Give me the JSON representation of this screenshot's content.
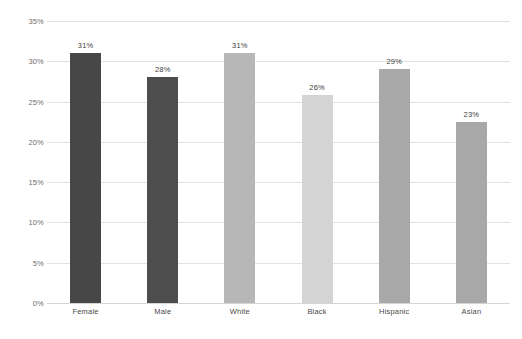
{
  "chart_data": {
    "type": "bar",
    "title": "",
    "subtitle": "",
    "xlabel": "",
    "ylabel": "",
    "categories": [
      "Female",
      "Male",
      "White",
      "Black",
      "Hispanic",
      "Asian"
    ],
    "values": [
      31,
      28,
      31,
      25.8,
      29,
      22.5
    ],
    "data_labels": [
      "31%",
      "28%",
      "31%",
      "26%",
      "29%",
      "23%"
    ],
    "ylim": [
      0,
      35
    ],
    "ytick_values": [
      0,
      5,
      10,
      15,
      20,
      25,
      30,
      35
    ],
    "ytick_labels": [
      "0%",
      "5%",
      "10%",
      "15%",
      "20%",
      "25%",
      "30%",
      "35%"
    ],
    "grid": "horizontal",
    "legend": "none",
    "bar_colors": [
      "#474747",
      "#4d4d4d",
      "#b7b7b7",
      "#d4d4d4",
      "#a8a8a8",
      "#a8a8a8"
    ],
    "gridline_color": "#e2e2e2",
    "baseline_color": "#d5d5d5",
    "label_color": "#4a4a4a",
    "background_color": "#ffffff"
  }
}
